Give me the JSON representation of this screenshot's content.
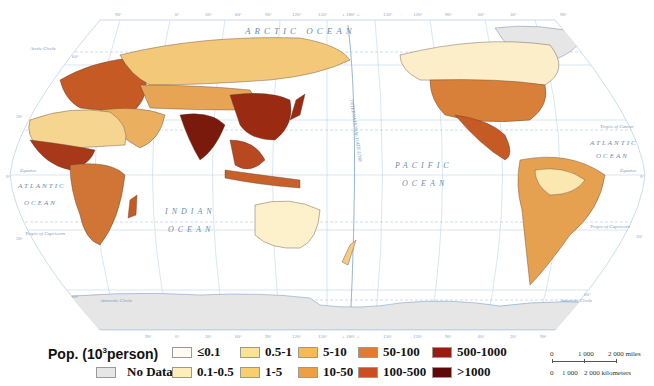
{
  "map": {
    "projection": "Robinson (Pacific-centered)",
    "top_longitude_labels": [
      "90°",
      "0°",
      "30°",
      "60°",
      "90°",
      "120°",
      "150°",
      "± 180° ±",
      "150°",
      "120°",
      "90°",
      "60°",
      "30°",
      "90°"
    ],
    "bottom_longitude_labels": [
      "90°",
      "0°",
      "30°",
      "60°",
      "90°",
      "120°",
      "150°",
      "± 180° ±",
      "150°",
      "120°",
      "90°",
      "60°",
      "30°",
      "90°"
    ],
    "latitude_labels": {
      "n60": "60°",
      "n30": "30°",
      "eq": "0°",
      "s30": "30°",
      "s60": "60°"
    },
    "reference_lines": {
      "arctic_circle": "Arctic Circle",
      "tropic_cancer": "Tropic of Cancer",
      "equator": "Equator",
      "tropic_capricorn": "Tropic of Capricorn",
      "antarctic_circle": "Antarctic Circle",
      "date_line": "INTERNATIONAL DATE LINE"
    },
    "ocean_labels": {
      "arctic": "ARCTIC OCEAN",
      "atlantic_left_1": "ATLANTIC",
      "atlantic_left_2": "OCEAN",
      "indian_1": "INDIAN",
      "indian_2": "OCEAN",
      "pacific_1": "PACIFIC",
      "pacific_2": "OCEAN",
      "atlantic_right_1": "ATLANTIC",
      "atlantic_right_2": "OCEAN"
    },
    "colors": {
      "ocean": "#ffffff",
      "graticule": "#a9c9e3",
      "coast": "#4a7fb5",
      "antarctica": "#e6e6e6",
      "label": "#5b7fa8"
    }
  },
  "legend": {
    "title_prefix": "Pop. (10",
    "title_sup": "3",
    "title_suffix": "person)",
    "no_data": {
      "label": "No Data",
      "color": "#e6e6e6"
    },
    "classes": [
      {
        "label": "≤0.1",
        "color": "#fffbf0"
      },
      {
        "label": "0.1-0.5",
        "color": "#fdedb8"
      },
      {
        "label": "0.5-1",
        "color": "#fbe19a"
      },
      {
        "label": "1-5",
        "color": "#f8cf6e"
      },
      {
        "label": "5-10",
        "color": "#f4bb52"
      },
      {
        "label": "10-50",
        "color": "#eea040"
      },
      {
        "label": "50-100",
        "color": "#e07b34"
      },
      {
        "label": "100-500",
        "color": "#cc4d20"
      },
      {
        "label": "500-1000",
        "color": "#9a1b10"
      },
      {
        "label": ">1000",
        "color": "#5e0808"
      }
    ]
  },
  "scale_bar": {
    "miles": [
      "0",
      "1 000",
      "2 000 miles"
    ],
    "kilometers": [
      "0",
      "1 000",
      "2 000 kilometers"
    ]
  }
}
